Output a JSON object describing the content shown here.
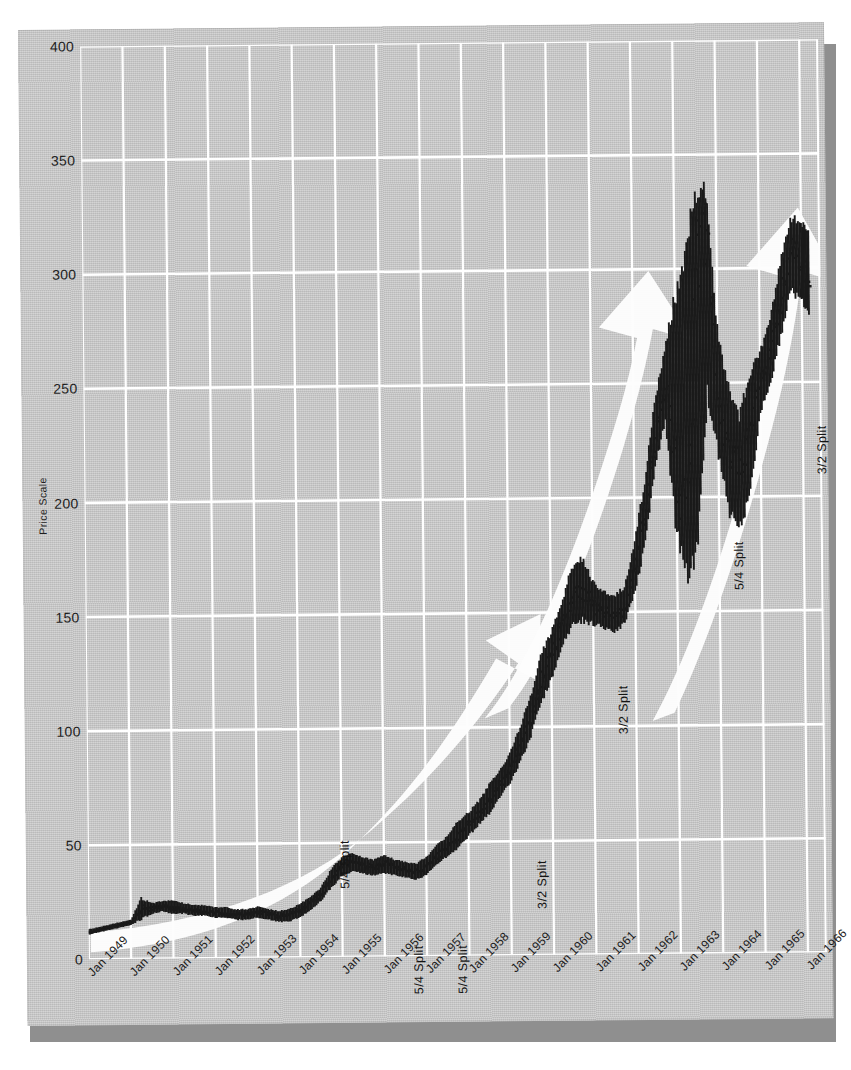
{
  "figure": {
    "kind": "scanned-stock-chart",
    "paper_color": "#c9c9c9",
    "grid_color": "#ffffff",
    "bar_color": "#1a1a1a",
    "arrow_color": "#fdfdfd",
    "shadow_color": "#8f8f8f"
  },
  "chart_data": {
    "type": "line",
    "title": "",
    "subtitle": "",
    "xlabel": "",
    "ylabel": "Price Scale",
    "grid": true,
    "legend": null,
    "ylim": [
      0,
      400
    ],
    "yticks": [
      0,
      50,
      100,
      150,
      200,
      250,
      300,
      350,
      400
    ],
    "ytick_labels": [
      "0",
      "50",
      "100",
      "150",
      "200",
      "250",
      "300",
      "350",
      "400"
    ],
    "xlim": [
      "Jan 1949",
      "Jan 1966"
    ],
    "xtick_labels": [
      "Jan 1949",
      "Jan 1950",
      "Jan 1951",
      "Jan 1952",
      "Jan 1953",
      "Jan 1954",
      "Jan 1955",
      "Jan 1956",
      "Jan 1957",
      "Jan 1958",
      "Jan 1959",
      "Jan 1960",
      "Jan 1961",
      "Jan 1962",
      "Jan 1963",
      "Jan 1964",
      "Jan 1965",
      "Jan 1966"
    ],
    "series_style": "ohlc-bars",
    "x": [
      1949.0,
      1949.25,
      1949.5,
      1949.75,
      1950.0,
      1950.25,
      1950.5,
      1950.75,
      1951.0,
      1951.25,
      1951.5,
      1951.75,
      1952.0,
      1952.25,
      1952.5,
      1952.75,
      1953.0,
      1953.25,
      1953.5,
      1953.75,
      1954.0,
      1954.25,
      1954.5,
      1954.75,
      1955.0,
      1955.25,
      1955.5,
      1955.75,
      1956.0,
      1956.25,
      1956.5,
      1956.75,
      1957.0,
      1957.25,
      1957.5,
      1957.75,
      1958.0,
      1958.25,
      1958.5,
      1958.75,
      1959.0,
      1959.25,
      1959.5,
      1959.75,
      1960.0,
      1960.25,
      1960.5,
      1960.75,
      1961.0,
      1961.25,
      1961.5,
      1961.75,
      1962.0,
      1962.25,
      1962.5,
      1962.75,
      1963.0,
      1963.25,
      1963.5,
      1963.75,
      1964.0,
      1964.25,
      1964.5,
      1964.75,
      1965.0,
      1965.25,
      1965.5,
      1965.75,
      1966.0,
      1966.2
    ],
    "high": [
      13,
      14,
      15,
      16,
      17,
      26,
      24,
      25,
      25,
      24,
      23,
      23,
      22,
      22,
      21,
      21,
      22,
      21,
      20,
      21,
      23,
      26,
      30,
      38,
      43,
      45,
      43,
      42,
      44,
      42,
      41,
      40,
      43,
      48,
      52,
      58,
      62,
      67,
      74,
      80,
      88,
      99,
      112,
      130,
      140,
      152,
      168,
      172,
      162,
      158,
      156,
      160,
      180,
      205,
      240,
      262,
      280,
      300,
      318,
      330,
      270,
      245,
      232,
      250,
      262,
      275,
      300,
      320,
      318,
      312
    ],
    "low": [
      11,
      12,
      13,
      14,
      15,
      18,
      20,
      21,
      20,
      20,
      19,
      19,
      18,
      18,
      17,
      17,
      18,
      17,
      16,
      16,
      18,
      21,
      25,
      31,
      36,
      38,
      37,
      36,
      37,
      36,
      35,
      34,
      36,
      41,
      44,
      48,
      53,
      58,
      63,
      70,
      76,
      86,
      97,
      112,
      122,
      136,
      146,
      148,
      146,
      144,
      142,
      146,
      160,
      182,
      215,
      236,
      190,
      170,
      195,
      250,
      222,
      196,
      190,
      205,
      238,
      252,
      272,
      292,
      288,
      282
    ],
    "close": [
      12,
      13,
      14,
      15,
      16,
      22,
      22,
      23,
      22,
      21,
      21,
      20,
      20,
      19,
      19,
      19,
      20,
      19,
      18,
      19,
      21,
      24,
      28,
      35,
      40,
      41,
      40,
      39,
      41,
      39,
      38,
      37,
      40,
      44,
      48,
      53,
      58,
      63,
      69,
      75,
      82,
      93,
      104,
      122,
      132,
      145,
      158,
      160,
      152,
      150,
      148,
      152,
      172,
      195,
      228,
      250,
      205,
      196,
      300,
      318,
      232,
      220,
      215,
      230,
      250,
      265,
      288,
      310,
      300,
      296
    ],
    "annotations": [
      {
        "label": "5/4 Split",
        "x_approx": "mid-1954",
        "orientation": "vertical"
      },
      {
        "label": "5/4 Split",
        "x_approx": "mid-1956",
        "orientation": "vertical"
      },
      {
        "label": "5/4 Split",
        "x_approx": "mid-1957",
        "orientation": "vertical"
      },
      {
        "label": "3/2 Split",
        "x_approx": "mid-1959",
        "orientation": "vertical"
      },
      {
        "label": "3/2 Split",
        "x_approx": "mid-1961",
        "orientation": "vertical"
      },
      {
        "label": "5/4 Split",
        "x_approx": "mid-1964",
        "orientation": "vertical"
      },
      {
        "label": "3/2 Split",
        "x_approx": "mid-1966",
        "orientation": "vertical"
      }
    ],
    "trend_arrows": [
      {
        "name": "arrow-1",
        "from": "1949",
        "to": "1959",
        "direction": "up-right"
      },
      {
        "name": "arrow-2",
        "from": "1959",
        "to": "1962",
        "direction": "up-right"
      },
      {
        "name": "arrow-3",
        "from": "1962",
        "to": "1966",
        "direction": "up-right"
      }
    ]
  },
  "axis": {
    "y_title": "Price Scale",
    "y_ticks": [
      "400",
      "350",
      "300",
      "250",
      "200",
      "150",
      "100",
      "50",
      "0"
    ],
    "x_ticks": [
      "Jan 1949",
      "Jan 1950",
      "Jan 1951",
      "Jan 1952",
      "Jan 1953",
      "Jan 1954",
      "Jan 1955",
      "Jan 1956",
      "Jan 1957",
      "Jan 1958",
      "Jan 1959",
      "Jan 1960",
      "Jan 1961",
      "Jan 1962",
      "Jan 1963",
      "Jan 1964",
      "Jan 1965",
      "Jan 1966"
    ]
  },
  "splits": [
    {
      "label": "5/4 Split",
      "left": 312,
      "top": 862
    },
    {
      "label": "5/4 Split",
      "left": 385,
      "top": 968
    },
    {
      "label": "5/4 Split",
      "left": 429,
      "top": 968
    },
    {
      "label": "3/2 Split",
      "left": 509,
      "top": 884
    },
    {
      "label": "3/2 Split",
      "left": 592,
      "top": 710
    },
    {
      "label": "5/4 Split",
      "left": 709,
      "top": 567
    },
    {
      "label": "3/2 Split",
      "left": 793,
      "top": 452
    }
  ]
}
